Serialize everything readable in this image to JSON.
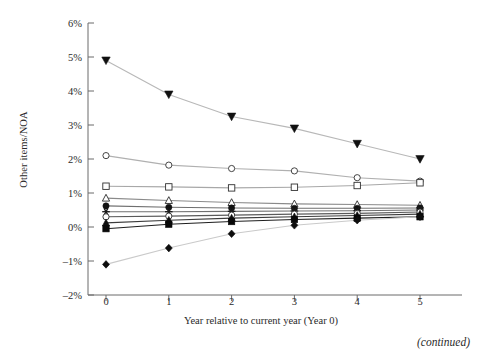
{
  "figure": {
    "caption_continued": "(continued)",
    "background_color": "#ffffff"
  },
  "axes": {
    "y_title": "Other items/NOA",
    "x_title": "Year relative to current year (Year 0)",
    "y_ticks": [
      "6%",
      "5%",
      "4%",
      "3%",
      "2%",
      "1%",
      "0%",
      "–1%",
      "–2%"
    ],
    "x_ticks": [
      "0",
      "1",
      "2",
      "3",
      "4",
      "5"
    ],
    "axis_color": "#6b6b6b"
  },
  "chart_data": {
    "type": "line",
    "title": "",
    "xlabel": "Year relative to current year (Year 0)",
    "ylabel": "Other items/NOA",
    "x": [
      0,
      1,
      2,
      3,
      4,
      5
    ],
    "xlim": [
      0,
      5
    ],
    "ylim": [
      -2,
      6
    ],
    "y_unit": "percent",
    "grid": false,
    "legend": "none",
    "series": [
      {
        "name": "portfolio-1-filled-triangle-down",
        "marker": "triangle-down-filled",
        "color": "#101010",
        "line_color": "#b8b8b8",
        "values": [
          4.9,
          3.9,
          3.25,
          2.9,
          2.45,
          2.0
        ]
      },
      {
        "name": "portfolio-2-open-circle",
        "marker": "circle-open",
        "color": "#303030",
        "line_color": "#b0b0b0",
        "values": [
          2.1,
          1.82,
          1.72,
          1.65,
          1.45,
          1.35
        ]
      },
      {
        "name": "portfolio-3-open-square",
        "marker": "square-open",
        "color": "#303030",
        "line_color": "#a8a8a8",
        "values": [
          1.2,
          1.18,
          1.15,
          1.17,
          1.22,
          1.3
        ]
      },
      {
        "name": "portfolio-4-open-triangle-up",
        "marker": "triangle-up-open",
        "color": "#2a2a2a",
        "line_color": "#8a8a8a",
        "values": [
          0.85,
          0.78,
          0.72,
          0.68,
          0.66,
          0.64
        ]
      },
      {
        "name": "portfolio-5-filled-circle",
        "marker": "circle-filled",
        "color": "#121212",
        "line_color": "#6f6f6f",
        "values": [
          0.62,
          0.58,
          0.56,
          0.55,
          0.55,
          0.56
        ]
      },
      {
        "name": "portfolio-6-star",
        "marker": "star",
        "color": "#1a1a1a",
        "line_color": "#707070",
        "values": [
          0.45,
          0.45,
          0.46,
          0.47,
          0.48,
          0.5
        ]
      },
      {
        "name": "portfolio-7-open-circle-small",
        "marker": "circle-open",
        "color": "#2a2a2a",
        "line_color": "#5a5a5a",
        "values": [
          0.3,
          0.32,
          0.35,
          0.38,
          0.4,
          0.44
        ]
      },
      {
        "name": "portfolio-8-filled-triangle-up",
        "marker": "triangle-up-filled",
        "color": "#0d0d0d",
        "line_color": "#3c3c3c",
        "values": [
          0.12,
          0.2,
          0.26,
          0.3,
          0.34,
          0.38
        ]
      },
      {
        "name": "portfolio-9-filled-square",
        "marker": "square-filled",
        "color": "#080808",
        "line_color": "#1e1e1e",
        "values": [
          -0.05,
          0.08,
          0.16,
          0.22,
          0.26,
          0.3
        ]
      },
      {
        "name": "portfolio-10-filled-diamond",
        "marker": "diamond-filled",
        "color": "#0d0d0d",
        "line_color": "#cacaca",
        "values": [
          -1.1,
          -0.62,
          -0.2,
          0.05,
          0.2,
          0.3
        ]
      }
    ]
  }
}
